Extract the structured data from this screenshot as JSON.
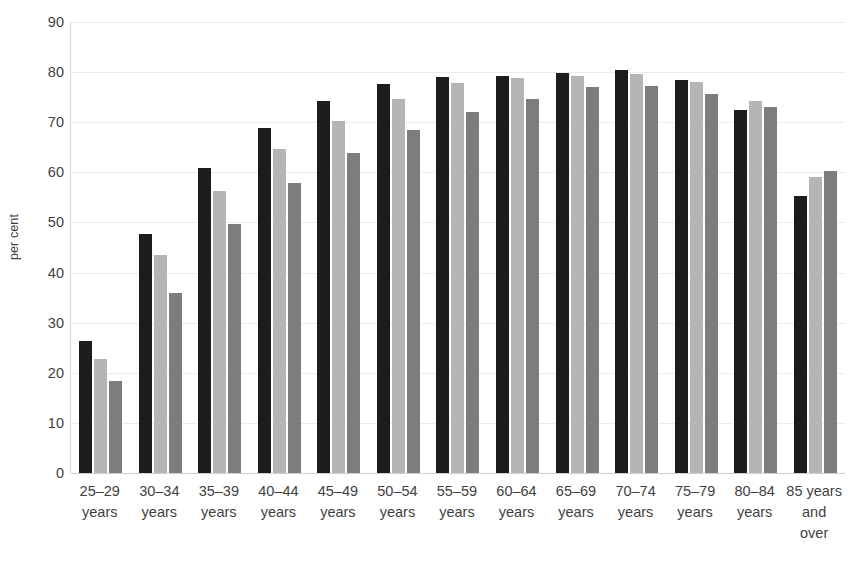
{
  "chart_data": {
    "type": "bar",
    "title": "",
    "subtitle": "",
    "xlabel": "",
    "ylabel": "per cent",
    "ylim": [
      0,
      90
    ],
    "ytick_step": 10,
    "yticks": [
      "90",
      "80",
      "70",
      "60",
      "50",
      "40",
      "30",
      "20",
      "10",
      "0"
    ],
    "grid": true,
    "legend": "none",
    "categories": [
      "25–29\nyears",
      "30–34\nyears",
      "35–39\nyears",
      "40–44\nyears",
      "45–49\nyears",
      "50–54\nyears",
      "55–59\nyears",
      "60–64\nyears",
      "65–69\nyears",
      "70–74\nyears",
      "75–79\nyears",
      "80–84\nyears",
      "85 years\nand\nover"
    ],
    "series": [
      {
        "name": "series-1",
        "color": "#1c1c1c",
        "values": [
          26.3,
          47.6,
          60.9,
          68.9,
          74.2,
          77.7,
          79.1,
          79.2,
          79.9,
          80.4,
          78.4,
          72.5,
          55.2
        ]
      },
      {
        "name": "series-2",
        "color": "#b5b5b5",
        "values": [
          22.8,
          43.6,
          56.3,
          64.6,
          70.3,
          74.6,
          77.9,
          78.9,
          79.3,
          79.6,
          78.0,
          74.3,
          59.0
        ]
      },
      {
        "name": "series-3",
        "color": "#7d7d7d",
        "values": [
          18.4,
          35.9,
          49.6,
          57.8,
          63.8,
          68.4,
          72.0,
          74.6,
          77.0,
          77.3,
          75.6,
          73.0,
          60.3
        ]
      }
    ]
  }
}
